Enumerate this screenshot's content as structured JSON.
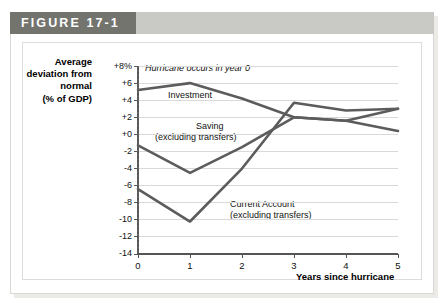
{
  "figure": {
    "label": "FIGURE 17-1"
  },
  "axes": {
    "y_title": "Average deviation from normal (% of GDP)",
    "y_title_lines": [
      "Average",
      "deviation from",
      "normal",
      "(% of GDP)"
    ],
    "x_title": "Years since hurricane",
    "y_ticks": [
      "+8%",
      "+6",
      "+4",
      "+2",
      "+0",
      "-2",
      "-4",
      "-6",
      "-8",
      "-10",
      "-12",
      "-14"
    ],
    "x_ticks": [
      "0",
      "1",
      "2",
      "3",
      "4",
      "5"
    ]
  },
  "annotations": {
    "hurricane_note": "Hurricane occurs in year 0",
    "investment_label": "Investment",
    "saving_label_line1": "Saving",
    "saving_label_line2": "(excluding transfers)",
    "current_account_label_line1": "Current Account",
    "current_account_label_line2": "(excluding transfers)"
  },
  "colors": {
    "line": "#5c5c5c",
    "grid": "#d9d9d9",
    "axis": "#555555",
    "header_tab": "#74746f",
    "header_band": "#c9c9c5",
    "plot_background": "#ffffff"
  },
  "chart_data": {
    "type": "line",
    "title": "FIGURE 17-1",
    "xlabel": "Years since hurricane",
    "ylabel": "Average deviation from normal (% of GDP)",
    "x": [
      0,
      1,
      2,
      3,
      4,
      5
    ],
    "xlim": [
      0,
      5
    ],
    "ylim": [
      -14,
      8
    ],
    "ytick_values": [
      8,
      6,
      4,
      2,
      0,
      -2,
      -4,
      -6,
      -8,
      -10,
      -12,
      -14
    ],
    "grid": "horizontal",
    "legend": "inline-labels",
    "series": [
      {
        "name": "Investment",
        "values": [
          5.2,
          6.0,
          4.2,
          2.0,
          1.6,
          0.4
        ]
      },
      {
        "name": "Saving (excluding transfers)",
        "values": [
          -1.3,
          -4.5,
          -1.5,
          2.0,
          1.6,
          3.0
        ]
      },
      {
        "name": "Current Account (excluding transfers)",
        "values": [
          -6.4,
          -10.2,
          -4.0,
          3.7,
          2.8,
          3.0
        ]
      }
    ],
    "vertical_marker": {
      "x": 0,
      "style": "dotted",
      "note": "Hurricane occurs in year 0"
    }
  }
}
